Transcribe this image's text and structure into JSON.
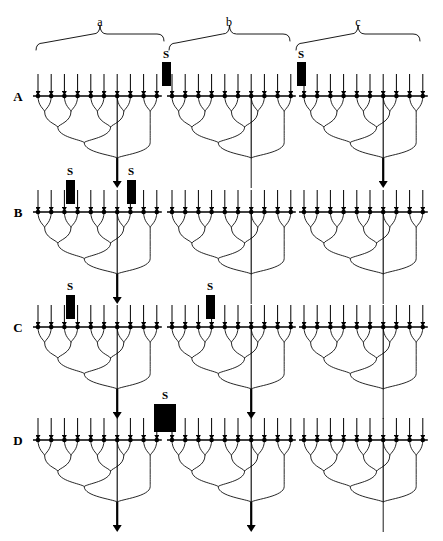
{
  "figure": {
    "type": "neural-convergence-diagram",
    "width": 443,
    "height": 541,
    "background_color": "#ffffff",
    "line_color": "#000000",
    "stimulus_color": "#000000"
  },
  "group_braces": [
    {
      "id": "a",
      "label": "a",
      "x_start": 36,
      "x_end": 164,
      "label_x": 100,
      "label_y": 26
    },
    {
      "id": "b",
      "label": "b",
      "x_start": 169,
      "x_end": 290,
      "label_x": 229,
      "label_y": 26
    },
    {
      "id": "c",
      "label": "c",
      "x_start": 296,
      "x_end": 420,
      "label_x": 358,
      "label_y": 26
    }
  ],
  "brace_geometry": {
    "top_y": 34,
    "bottom_y": 50,
    "tip_rise": 9
  },
  "stimulus_label": "S",
  "tree_geometry": {
    "terminals_per_tree": 10,
    "terminal_spacing": 13.2,
    "afferent_length": 22,
    "levels": 4,
    "tree_depth": 62,
    "output_length": 30
  },
  "trees_x": {
    "a_start": 38,
    "b_start": 172,
    "c_start": 304
  },
  "rows": [
    {
      "id": "A",
      "label": "A",
      "baseline_y": 96,
      "label_x": 18,
      "stimuli": [
        {
          "x": 162,
          "y": 62,
          "width": 9,
          "height": 24,
          "label": "S",
          "label_x": 166,
          "label_y": 58,
          "group": "a",
          "position": "boundary-a-b"
        },
        {
          "x": 297,
          "y": 62,
          "width": 9,
          "height": 24,
          "label": "S",
          "label_x": 301,
          "label_y": 58,
          "group": "c",
          "position": "boundary-b-c"
        }
      ],
      "outputs": [
        {
          "group": "a",
          "active": true
        },
        {
          "group": "b",
          "active": false
        },
        {
          "group": "c",
          "active": true
        }
      ]
    },
    {
      "id": "B",
      "label": "B",
      "baseline_y": 212,
      "label_x": 18,
      "stimuli": [
        {
          "x": 66,
          "y": 180,
          "width": 9,
          "height": 24,
          "label": "S",
          "label_x": 70,
          "label_y": 175,
          "group": "a",
          "position": "terminal-3"
        },
        {
          "x": 127,
          "y": 180,
          "width": 9,
          "height": 24,
          "label": "S",
          "label_x": 131,
          "label_y": 175,
          "group": "a",
          "position": "terminal-8"
        }
      ],
      "outputs": [
        {
          "group": "a",
          "active": true
        },
        {
          "group": "b",
          "active": false
        },
        {
          "group": "c",
          "active": false
        }
      ]
    },
    {
      "id": "C",
      "label": "C",
      "baseline_y": 327,
      "label_x": 18,
      "stimuli": [
        {
          "x": 66,
          "y": 295,
          "width": 9,
          "height": 24,
          "label": "S",
          "label_x": 70,
          "label_y": 290,
          "group": "a",
          "position": "terminal-3"
        },
        {
          "x": 206,
          "y": 295,
          "width": 9,
          "height": 24,
          "label": "S",
          "label_x": 210,
          "label_y": 290,
          "group": "b",
          "position": "terminal-3"
        }
      ],
      "outputs": [
        {
          "group": "a",
          "active": true
        },
        {
          "group": "b",
          "active": true
        },
        {
          "group": "c",
          "active": false
        }
      ]
    },
    {
      "id": "D",
      "label": "D",
      "baseline_y": 440,
      "label_x": 18,
      "stimuli": [
        {
          "x": 154,
          "y": 404,
          "width": 22,
          "height": 28,
          "label": "S",
          "label_x": 165,
          "label_y": 399,
          "group": "a-b",
          "position": "wide-boundary-a-b"
        }
      ],
      "outputs": [
        {
          "group": "a",
          "active": true
        },
        {
          "group": "b",
          "active": true
        },
        {
          "group": "c",
          "active": false
        }
      ]
    }
  ]
}
